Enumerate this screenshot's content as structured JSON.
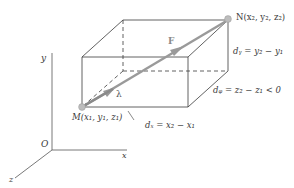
{
  "diagram": {
    "points": {
      "M": {
        "label": "M(x₁, y₁, z₁)"
      },
      "N": {
        "label": "N(x₂, y₂, z₂)"
      },
      "O": {
        "label": "O"
      }
    },
    "axes": {
      "x": "x",
      "y": "y",
      "z": "z"
    },
    "vectors": {
      "force": "F",
      "unit": "λ"
    },
    "dimensions": {
      "dx": "dₓ = x₂ − x₁",
      "dy": "dᵧ = y₂ − y₁",
      "dz": "dᵩ = z₂ − z₁ < 0"
    },
    "colors": {
      "line": "#3a3a3a",
      "vector": "#9a9a9a",
      "point": "#b5b5b5"
    }
  }
}
